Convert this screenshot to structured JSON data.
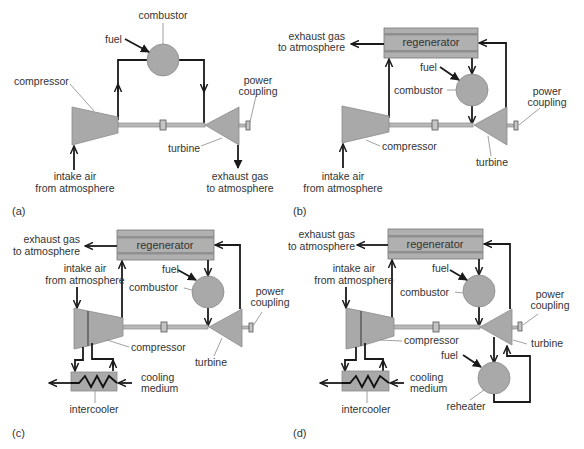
{
  "figure": {
    "panels": [
      {
        "id": "a",
        "panel_label": "(a)",
        "labels": {
          "combustor": "combustor",
          "fuel": "fuel",
          "compressor": "compressor",
          "power_line1": "power",
          "power_line2": "coupling",
          "turbine": "turbine",
          "intake_line1": "intake air",
          "intake_line2": "from atmosphere",
          "exhaust_line1": "exhaust gas",
          "exhaust_line2": "to atmosphere"
        }
      },
      {
        "id": "b",
        "panel_label": "(b)",
        "labels": {
          "regenerator": "regenerator",
          "exhaust_line1": "exhaust gas",
          "exhaust_line2": "to atmosphere",
          "fuel": "fuel",
          "combustor": "combustor",
          "power_line1": "power",
          "power_line2": "coupling",
          "compressor": "compressor",
          "turbine": "turbine",
          "intake_line1": "intake air",
          "intake_line2": "from atmosphere"
        }
      },
      {
        "id": "c",
        "panel_label": "(c)",
        "labels": {
          "regenerator": "regenerator",
          "exhaust_line1": "exhaust gas",
          "exhaust_line2": "to atmosphere",
          "intake_line1": "intake air",
          "intake_line2": "from atmosphere",
          "fuel": "fuel",
          "combustor": "combustor",
          "power_line1": "power",
          "power_line2": "coupling",
          "compressor": "compressor",
          "turbine": "turbine",
          "cooling_line1": "cooling",
          "cooling_line2": "medium",
          "intercooler": "intercooler"
        }
      },
      {
        "id": "d",
        "panel_label": "(d)",
        "labels": {
          "regenerator": "regenerator",
          "exhaust_line1": "exhaust gas",
          "exhaust_line2": "to atmosphere",
          "intake_line1": "intake air",
          "intake_line2": "from  atmosphere",
          "fuel": "fuel",
          "combustor": "combustor",
          "power_line1": "power",
          "power_line2": "coupling",
          "compressor": "compressor",
          "turbine": "turbine",
          "fuel_reheater": "fuel",
          "reheater": "reheater",
          "cooling_line1": "cooling",
          "cooling_line2": "medium",
          "intercooler": "intercooler"
        }
      }
    ],
    "colors": {
      "component_fill": "#a9a9a9",
      "pipe": "#1a1a1a",
      "text": "#333333",
      "background": "#ffffff"
    }
  }
}
